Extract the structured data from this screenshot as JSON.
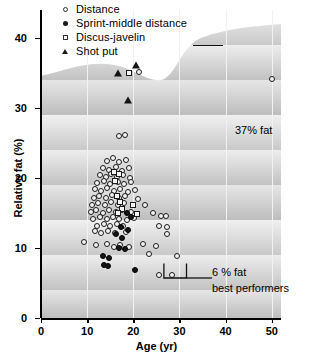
{
  "chart_data": {
    "type": "scatter",
    "title": "",
    "xlabel": "Age (yr)",
    "ylabel": "Relative fat (%)",
    "xlim": [
      0,
      52
    ],
    "ylim": [
      0,
      44
    ],
    "xticks": [
      0,
      10,
      20,
      30,
      40,
      50
    ],
    "yticks": [
      0,
      10,
      20,
      30,
      40
    ],
    "grid": true,
    "legend_position": "top-left",
    "series": [
      {
        "name": "Distance",
        "marker": "open-circle",
        "points": [
          [
            16.8,
            26.0
          ],
          [
            18.3,
            26.1
          ],
          [
            21.2,
            35.2
          ],
          [
            50.0,
            34.2
          ],
          [
            14.2,
            22.5
          ],
          [
            15.6,
            22.8
          ],
          [
            17.0,
            22.3
          ],
          [
            18.4,
            22.6
          ],
          [
            13.4,
            21.4
          ],
          [
            14.8,
            21.2
          ],
          [
            16.2,
            21.6
          ],
          [
            17.6,
            21.0
          ],
          [
            19.0,
            21.5
          ],
          [
            12.8,
            20.4
          ],
          [
            14.0,
            20.2
          ],
          [
            15.2,
            20.6
          ],
          [
            16.4,
            20.1
          ],
          [
            17.8,
            20.5
          ],
          [
            19.2,
            20.0
          ],
          [
            12.2,
            19.3
          ],
          [
            13.6,
            19.6
          ],
          [
            15.0,
            19.1
          ],
          [
            16.6,
            19.4
          ],
          [
            18.0,
            19.2
          ],
          [
            19.6,
            19.5
          ],
          [
            11.8,
            18.4
          ],
          [
            13.0,
            18.1
          ],
          [
            14.4,
            18.6
          ],
          [
            15.8,
            18.2
          ],
          [
            17.2,
            18.5
          ],
          [
            18.8,
            18.0
          ],
          [
            20.4,
            18.3
          ],
          [
            11.4,
            17.2
          ],
          [
            12.6,
            17.5
          ],
          [
            14.0,
            17.1
          ],
          [
            15.4,
            17.6
          ],
          [
            16.8,
            17.2
          ],
          [
            18.2,
            17.4
          ],
          [
            21.0,
            17.0
          ],
          [
            11.0,
            16.2
          ],
          [
            12.4,
            16.5
          ],
          [
            13.8,
            16.1
          ],
          [
            15.2,
            16.6
          ],
          [
            16.6,
            16.2
          ],
          [
            18.0,
            16.4
          ],
          [
            22.6,
            16.1
          ],
          [
            10.8,
            15.1
          ],
          [
            12.0,
            15.4
          ],
          [
            13.4,
            15.0
          ],
          [
            14.8,
            15.5
          ],
          [
            16.2,
            15.2
          ],
          [
            17.6,
            15.4
          ],
          [
            19.4,
            15.1
          ],
          [
            24.2,
            15.0
          ],
          [
            11.2,
            14.2
          ],
          [
            12.8,
            14.5
          ],
          [
            14.2,
            14.1
          ],
          [
            15.6,
            14.4
          ],
          [
            17.0,
            14.2
          ],
          [
            18.6,
            14.0
          ],
          [
            20.2,
            14.3
          ],
          [
            26.0,
            14.6
          ],
          [
            27.0,
            14.6
          ],
          [
            12.2,
            13.2
          ],
          [
            13.6,
            13.5
          ],
          [
            15.0,
            13.1
          ],
          [
            16.4,
            13.4
          ],
          [
            17.8,
            13.2
          ],
          [
            25.6,
            13.1
          ],
          [
            27.4,
            13.0
          ],
          [
            11.6,
            12.4
          ],
          [
            13.0,
            12.1
          ],
          [
            14.6,
            12.5
          ],
          [
            16.0,
            12.2
          ],
          [
            18.4,
            12.3
          ],
          [
            27.2,
            12.0
          ],
          [
            9.4,
            10.8
          ],
          [
            12.0,
            10.5
          ],
          [
            14.2,
            10.6
          ],
          [
            15.8,
            10.2
          ],
          [
            17.2,
            10.4
          ],
          [
            19.0,
            10.1
          ],
          [
            22.0,
            10.6
          ],
          [
            25.0,
            10.3
          ],
          [
            23.4,
            9.2
          ],
          [
            29.4,
            8.9
          ],
          [
            25.6,
            6.1
          ],
          [
            28.4,
            6.1
          ]
        ]
      },
      {
        "name": "Sprint-middle distance",
        "marker": "filled-circle",
        "points": [
          [
            18.6,
            15.0
          ],
          [
            19.6,
            14.4
          ],
          [
            17.4,
            13.0
          ],
          [
            18.8,
            12.6
          ],
          [
            16.2,
            12.0
          ],
          [
            17.6,
            11.4
          ],
          [
            16.8,
            10.0
          ],
          [
            18.2,
            9.8
          ],
          [
            13.4,
            8.8
          ],
          [
            14.8,
            8.6
          ],
          [
            13.6,
            7.6
          ],
          [
            14.6,
            7.4
          ],
          [
            20.4,
            6.9
          ]
        ]
      },
      {
        "name": "Discus-javelin",
        "marker": "open-square",
        "points": [
          [
            19.0,
            35.0
          ],
          [
            15.8,
            20.8
          ],
          [
            16.8,
            20.6
          ],
          [
            16.0,
            19.6
          ],
          [
            16.4,
            17.4
          ],
          [
            17.2,
            16.6
          ],
          [
            17.6,
            15.6
          ],
          [
            16.6,
            15.0
          ],
          [
            20.0,
            16.2
          ],
          [
            20.8,
            14.8
          ]
        ]
      },
      {
        "name": "Shot put",
        "marker": "filled-triangle",
        "points": [
          [
            16.6,
            35.0
          ],
          [
            20.6,
            36.1
          ],
          [
            18.8,
            31.2
          ]
        ]
      }
    ],
    "annotations": [
      {
        "id": "fat37",
        "text": "37% fat",
        "target": [
          21.2,
          35.2
        ]
      },
      {
        "id": "fat6",
        "text": "6 % fat",
        "sub": "best performers",
        "targets": [
          [
            25.6,
            6.1
          ],
          [
            28.4,
            6.1
          ]
        ]
      }
    ]
  },
  "legend": {
    "items": [
      {
        "label": "Distance",
        "marker": "open-circle"
      },
      {
        "label": "Sprint-middle distance",
        "marker": "filled-circle"
      },
      {
        "label": "Discus-javelin",
        "marker": "open-square"
      },
      {
        "label": "Shot put",
        "marker": "filled-triangle"
      }
    ]
  },
  "axes": {
    "x_title": "Age (yr)",
    "y_title": "Relative fat (%)",
    "x_tick_labels": [
      "0",
      "10",
      "20",
      "30",
      "40",
      "50"
    ],
    "y_tick_labels": [
      "0",
      "10",
      "20",
      "30",
      "40"
    ]
  },
  "annotations": {
    "fat37_label": "37% fat",
    "fat6_label": "6 % fat",
    "best_performers_label": "best performers"
  },
  "colors": {
    "marker_outline": "#1b1b1b",
    "marker_fill_open": "#f2f2f2",
    "marker_fill_solid": "#151515",
    "background_light": "#e9e9e9",
    "background_dark": "#bdbdbd",
    "gridline": "#f2f2f2"
  }
}
